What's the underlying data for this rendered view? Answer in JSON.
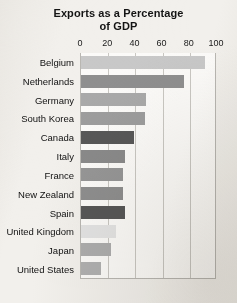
{
  "chart_data": {
    "type": "bar",
    "orientation": "horizontal",
    "title": "Exports as a Percentage of GDP",
    "title_lines": [
      "Exports as a Percentage",
      "of GDP"
    ],
    "xlabel": "",
    "ylabel": "",
    "xlim": [
      0,
      100
    ],
    "xticks": [
      0,
      20,
      40,
      60,
      80,
      100
    ],
    "xtick_labels": [
      "0",
      "20",
      "40",
      "60",
      "80",
      "100"
    ],
    "grid": "vertical",
    "legend": "none",
    "categories": [
      "Belgium",
      "Netherlands",
      "Germany",
      "South Korea",
      "Canada",
      "Italy",
      "France",
      "New Zealand",
      "Spain",
      "United Kingdom",
      "Japan",
      "United States"
    ],
    "values": [
      91,
      76,
      48,
      47,
      39,
      32,
      31,
      31,
      32,
      26,
      22,
      15
    ],
    "bar_colors": [
      "#c8c8c8",
      "#8f8f8f",
      "#a9a9a9",
      "#9d9d9d",
      "#585858",
      "#8a8a8a",
      "#969696",
      "#8e8e8e",
      "#575757",
      "#e3e3e3",
      "#adadad",
      "#b0b0b0"
    ]
  },
  "style": {
    "page_background": "#f2f0ec",
    "plot_background": "#fbfaf8",
    "gridline_color": "#c9c7c2",
    "axis_color": "#b9b7b2",
    "text_color": "#141414"
  }
}
